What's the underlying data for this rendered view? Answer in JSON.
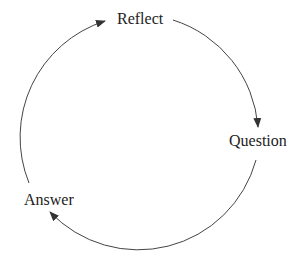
{
  "diagram": {
    "type": "cycle",
    "nodes": [
      {
        "id": "reflect",
        "label": "Reflect"
      },
      {
        "id": "question",
        "label": "Question"
      },
      {
        "id": "answer",
        "label": "Answer"
      }
    ],
    "edges": [
      {
        "from": "reflect",
        "to": "question"
      },
      {
        "from": "question",
        "to": "answer"
      },
      {
        "from": "answer",
        "to": "reflect"
      }
    ],
    "colors": {
      "stroke": "#444444",
      "text": "#222222",
      "background": "#ffffff"
    }
  }
}
